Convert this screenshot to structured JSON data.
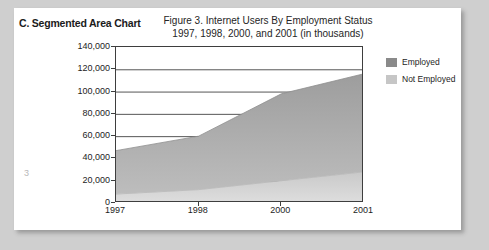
{
  "page": {
    "number": "3",
    "section_heading": "C. Segmented Area Chart"
  },
  "legend": {
    "position": "right",
    "items": [
      {
        "label": "Employed",
        "color": "#8a8a8a"
      },
      {
        "label": "Not Employed",
        "color": "#c6c6c6"
      }
    ]
  },
  "chart_data": {
    "type": "area",
    "stacked": true,
    "title": "Figure 3. Internet Users By Employment Status",
    "subtitle": "1997, 1998, 2000, and 2001 (in thousands)",
    "xlabel": "",
    "ylabel": "",
    "categories": [
      "1997",
      "1998",
      "2000",
      "2001"
    ],
    "x_tick_labels": [
      "1997",
      "1998",
      "2000",
      "2001"
    ],
    "y_tick_labels": [
      "140,000",
      "120,000",
      "100,000",
      "80,000",
      "60,000",
      "40,000",
      "20,000",
      "0"
    ],
    "ylim": [
      0,
      140000
    ],
    "y_tick_step": 20000,
    "grid": true,
    "grid_axis": "y",
    "series": [
      {
        "name": "Not Employed",
        "color": "#c6c6c6",
        "values": [
          8000,
          12000,
          20000,
          28000
        ]
      },
      {
        "name": "Employed",
        "color": "#8a8a8a",
        "values": [
          39000,
          48000,
          78000,
          88000
        ]
      }
    ],
    "totals": [
      47000,
      60000,
      98000,
      116000
    ]
  }
}
